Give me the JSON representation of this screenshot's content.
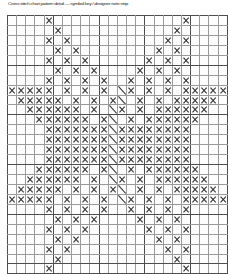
{
  "header": {
    "caption": "Cross stitch chart pattern detail  —  symbol key / designer note strip",
    "caption_visible_as": "tiny-illegible-text"
  },
  "chart_panel": {
    "title": "Cross Stitch Pattern Chart",
    "grid_line_color": "#9a9a9a",
    "heavy_line_color": "#4d4d4d",
    "symbol_color": "#333333",
    "cell_background": "#fdfdfd",
    "filled_cell_background": "#f4f4f4",
    "heavy_line_every": 5
  },
  "chart_data": {
    "type": "heatmap",
    "xlabel": "",
    "ylabel": "",
    "columns": 24,
    "rows": 26,
    "grid": true,
    "legend": [
      {
        "symbol": "X",
        "name": "full-cross-stitch",
        "code": "x"
      },
      {
        "symbol": "\\",
        "name": "backstitch-diagonal",
        "code": "d"
      },
      {
        "symbol": "",
        "name": "empty-cell",
        "code": "."
      }
    ],
    "cells": [
      "....x..............x....",
      ".....x............x.....",
      "....x.x..........x.x....",
      ".....x.x........x.x.....",
      "....x.x.x......x.x.x....",
      ".....x.x.x....x.x.x.....",
      "....x.x.x.x..x.x.x.x....",
      "xxxxx.x.x.x.dx.x.x.xxxxx",
      ".xxxxx.x.x.xd.x.x.xxxxx.",
      "..xxxxxx.x.dx.x.xxxxxx..",
      "...xxxxxx.xd.x.xxxxxx...",
      "....xxxxxxxdxxxxxxxx....",
      "....xxxxxxxdxxxxxxxx....",
      "....xxxxxxxdxxxxxxxx....",
      "....xxxxxxxdxxxxxxxx....",
      "...xxxxxx.xd.x.xxxxxx...",
      "..xxxxxx.x.dx.x.xxxxxx..",
      ".xxxxx.x.x.xd.x.x.xxxxx.",
      "xxxxx.x.x.x.dx.x.x.xxxxx",
      "....x.x.x.x..x.x.x.x....",
      ".....x.x.x....x.x.x.....",
      "....x.x.x......x.x.x....",
      ".....x.x........x.x.....",
      "....x.x..........x.x....",
      ".....x............x.....",
      "....x..............x...."
    ]
  }
}
